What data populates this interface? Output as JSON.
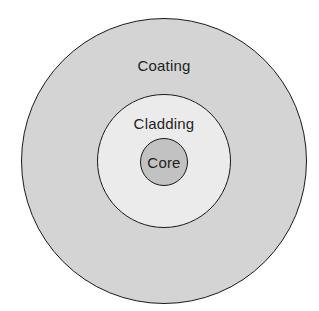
{
  "diagram": {
    "layers": [
      {
        "id": "coating",
        "label": "Coating",
        "fill": "#d4d4d4",
        "cx": 164,
        "cy": 161,
        "r": 143,
        "label_x": 164,
        "label_y": 65
      },
      {
        "id": "cladding",
        "label": "Cladding",
        "fill": "#ebebeb",
        "cx": 164,
        "cy": 161,
        "r": 67,
        "label_x": 164,
        "label_y": 123
      },
      {
        "id": "core",
        "label": "Core",
        "fill": "#c2c2c2",
        "cx": 164,
        "cy": 162,
        "r": 24,
        "label_x": 164,
        "label_y": 162
      }
    ],
    "stroke_color": "#1a1a1a",
    "background": "#ffffff"
  }
}
